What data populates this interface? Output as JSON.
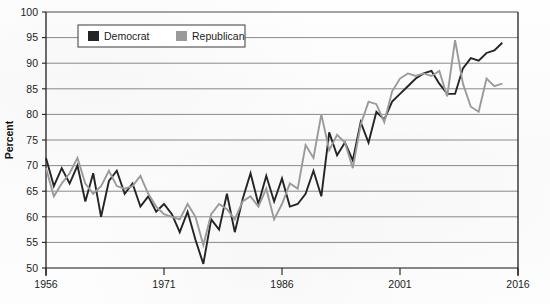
{
  "chart_data": {
    "type": "line",
    "title": "",
    "subtitle": "",
    "xlabel": "",
    "ylabel": "Percent",
    "xlim": [
      1956,
      2016
    ],
    "ylim": [
      50,
      100
    ],
    "ytick_step": 5,
    "yticks": [
      50,
      55,
      60,
      65,
      70,
      75,
      80,
      85,
      90,
      95,
      100
    ],
    "xticks": [
      1956,
      1971,
      1986,
      2001,
      2016
    ],
    "xtick_labels": [
      "1956",
      "1971",
      "1986",
      "2001",
      "2016"
    ],
    "ytick_labels": [
      "50",
      "55",
      "60",
      "65",
      "70",
      "75",
      "80",
      "85",
      "90",
      "95",
      "100"
    ],
    "grid": "horizontal",
    "legend_position": "top-left-inside",
    "legend": [
      "Democrat",
      "Republican"
    ],
    "x": [
      1956,
      1957,
      1958,
      1959,
      1960,
      1961,
      1962,
      1963,
      1964,
      1965,
      1966,
      1967,
      1968,
      1969,
      1970,
      1971,
      1972,
      1973,
      1974,
      1975,
      1976,
      1977,
      1978,
      1979,
      1980,
      1981,
      1982,
      1983,
      1984,
      1985,
      1986,
      1987,
      1988,
      1989,
      1990,
      1991,
      1992,
      1993,
      1994,
      1995,
      1996,
      1997,
      1998,
      1999,
      2000,
      2001,
      2002,
      2003,
      2004,
      2005,
      2006,
      2007,
      2008,
      2009,
      2010,
      2011,
      2012,
      2013,
      2014
    ],
    "series": [
      {
        "name": "Democrat",
        "color": "#242424",
        "values": [
          71.5,
          66.0,
          69.5,
          66.5,
          70.0,
          63.0,
          68.5,
          60.0,
          67.0,
          69.0,
          64.5,
          66.5,
          62.0,
          64.0,
          61.0,
          62.5,
          60.5,
          57.0,
          61.0,
          55.5,
          50.8,
          59.5,
          57.5,
          64.5,
          57.0,
          63.5,
          68.5,
          62.5,
          68.0,
          63.0,
          67.5,
          62.0,
          62.5,
          64.5,
          69.0,
          64.0,
          76.5,
          72.0,
          74.5,
          71.0,
          78.5,
          74.5,
          80.5,
          79.0,
          82.5,
          84.0,
          85.5,
          87.0,
          88.0,
          88.5,
          86.0,
          84.0,
          84.0,
          89.0,
          91.0,
          90.5,
          92.0,
          92.5,
          94.0
        ]
      },
      {
        "name": "Republican",
        "color": "#9a9a9a",
        "values": [
          69.5,
          64.0,
          66.5,
          68.5,
          71.5,
          66.5,
          64.5,
          66.0,
          69.0,
          66.0,
          65.5,
          66.0,
          68.0,
          64.5,
          62.0,
          60.5,
          60.0,
          59.5,
          62.5,
          60.0,
          54.5,
          60.5,
          62.5,
          61.5,
          59.5,
          63.0,
          64.0,
          62.0,
          65.5,
          59.5,
          62.5,
          66.5,
          65.5,
          74.0,
          71.5,
          80.0,
          73.0,
          76.0,
          74.5,
          69.5,
          78.0,
          82.5,
          82.0,
          78.5,
          84.5,
          87.0,
          88.0,
          87.5,
          88.0,
          87.5,
          88.5,
          83.5,
          94.5,
          86.0,
          81.5,
          80.5,
          87.0,
          85.5,
          86.0
        ]
      }
    ]
  },
  "legend": {
    "items": [
      {
        "label": "Democrat",
        "color": "#242424"
      },
      {
        "label": "Republican",
        "color": "#9a9a9a"
      }
    ]
  },
  "axes": {
    "y_title": "Percent"
  }
}
